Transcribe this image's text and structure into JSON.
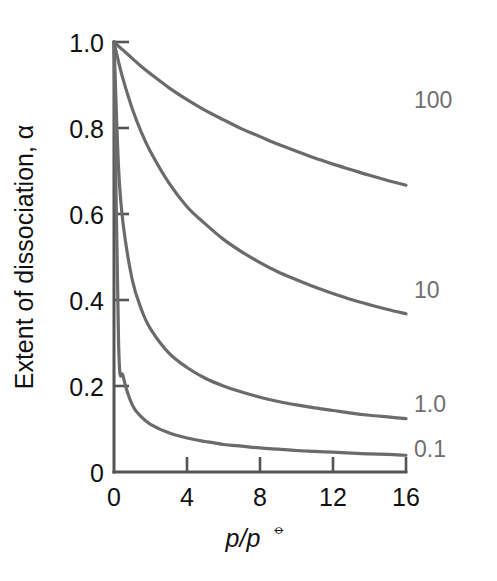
{
  "chart_data": {
    "type": "line",
    "title": "",
    "subtitle": "",
    "xlabel": "p/p",
    "xlabel_superscript": "⦵",
    "ylabel": "Extent of dissociation, α",
    "xlim": [
      0,
      16
    ],
    "ylim": [
      0,
      1.0
    ],
    "xticks": [
      "0",
      "4",
      "8",
      "12",
      "16"
    ],
    "xtick_values": [
      0,
      4,
      8,
      12,
      16
    ],
    "yticks": [
      "0",
      "0.2",
      "0.4",
      "0.6",
      "0.8",
      "1.0"
    ],
    "ytick_values": [
      0,
      0.2,
      0.4,
      0.6,
      0.8,
      1.0
    ],
    "grid": false,
    "legend_position": "inline-right-of-curve-ends",
    "curve_color": "#6b6b6b",
    "axis_color": "#555555",
    "label_color": "#6f6f6f",
    "x": [
      0,
      0.25,
      0.5,
      1,
      1.5,
      2,
      3,
      4,
      5,
      6,
      7,
      8,
      9,
      10,
      11,
      12,
      13,
      14,
      15,
      16
    ],
    "series": [
      {
        "name": "100",
        "label": "100",
        "label_x": 16.3,
        "label_y": 0.845,
        "values": [
          1.0,
          0.99,
          0.981,
          0.962,
          0.943,
          0.926,
          0.894,
          0.866,
          0.841,
          0.819,
          0.798,
          0.78,
          0.762,
          0.746,
          0.73,
          0.716,
          0.703,
          0.69,
          0.678,
          0.667
        ]
      },
      {
        "name": "10",
        "label": "10",
        "label_x": 16.3,
        "label_y": 0.425,
        "values": [
          1.0,
          0.954,
          0.913,
          0.845,
          0.79,
          0.745,
          0.673,
          0.617,
          0.577,
          0.541,
          0.512,
          0.487,
          0.465,
          0.447,
          0.43,
          0.415,
          0.401,
          0.389,
          0.378,
          0.368
        ]
      },
      {
        "name": "1.0",
        "label": "1.0",
        "label_x": 16.3,
        "label_y": 0.165,
        "values": [
          1.0,
          0.707,
          0.577,
          0.447,
          0.378,
          0.333,
          0.277,
          0.243,
          0.218,
          0.2,
          0.186,
          0.174,
          0.164,
          0.156,
          0.149,
          0.143,
          0.137,
          0.132,
          0.128,
          0.124
        ]
      },
      {
        "name": "0.1",
        "label": "0.1",
        "label_x": 16.3,
        "label_y": 0.065,
        "values": [
          1.0,
          0.302,
          0.223,
          0.156,
          0.128,
          0.111,
          0.091,
          0.079,
          0.071,
          0.064,
          0.06,
          0.056,
          0.053,
          0.05,
          0.048,
          0.046,
          0.044,
          0.042,
          0.041,
          0.039
        ]
      }
    ],
    "note": "alpha = sqrt(K / (K + 4p)) for equilibrium constants K = 100, 10, 1.0, 0.1"
  }
}
